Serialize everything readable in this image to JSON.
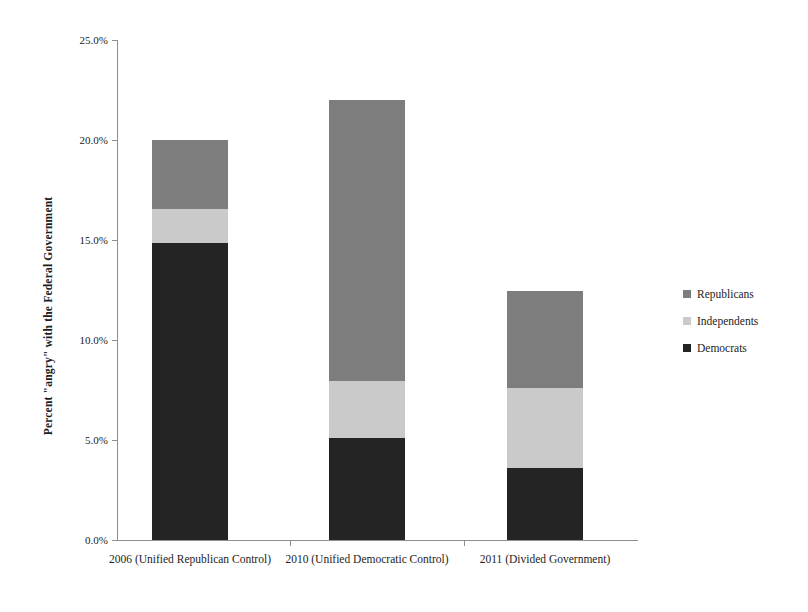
{
  "chart_data": {
    "type": "bar",
    "subtype": "stacked-bar",
    "title": "",
    "xlabel": "",
    "ylabel": "Percent \"angry\" with the Federal Government",
    "ylim": [
      0,
      25
    ],
    "ytick_values": [
      0,
      5,
      10,
      15,
      20,
      25
    ],
    "ytick_labels": [
      "0.0%",
      "5.0%",
      "10.0%",
      "15.0%",
      "20.0%",
      "25.0%"
    ],
    "grid": false,
    "legend_position": "right",
    "categories": [
      "2006 (Unified Republican Control)",
      "2010 (Unified Democratic Control)",
      "2011 (Divided Government)"
    ],
    "series": [
      {
        "name": "Democrats",
        "color": "#242424",
        "values": [
          14.85,
          5.1,
          3.6
        ]
      },
      {
        "name": "Independents",
        "color": "#cacaca",
        "values": [
          1.7,
          2.85,
          4.0
        ]
      },
      {
        "name": "Republicans",
        "color": "#7d7d7d",
        "values": [
          3.45,
          14.05,
          4.85
        ]
      }
    ],
    "totals": [
      20.0,
      22.0,
      12.45
    ],
    "legend": [
      {
        "label": "Republicans",
        "color": "#7d7d7d"
      },
      {
        "label": "Independents",
        "color": "#cacaca"
      },
      {
        "label": "Democrats",
        "color": "#242424"
      }
    ]
  }
}
